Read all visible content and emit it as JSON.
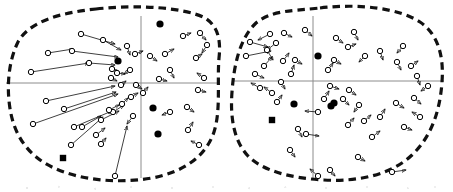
{
  "figure": {
    "type": "scatter",
    "width": 453,
    "height": 192,
    "background_color": "#ffffff",
    "stroke_color": "#000000",
    "axis_color": "#8c8c8c",
    "dash_color": "#111111",
    "marker_legend": [
      {
        "key": "open-circle-with-vector",
        "label": "open circle with velocity vector arrow"
      },
      {
        "key": "filled-circle",
        "label": "filled black circle"
      },
      {
        "key": "filled-square",
        "label": "filled black square"
      }
    ],
    "panels": [
      {
        "name": "left-panel",
        "axis": {
          "cx": 141,
          "cy": 83,
          "x_from": 6,
          "x_to": 218,
          "y_from": 16,
          "y_to": 178
        },
        "boundary": "M 96 9 C 140 4 186 8 205 18 C 218 26 221 40 219 58 C 217 82 221 110 214 132 C 206 156 184 172 152 178 C 118 184 80 180 54 168 C 30 157 16 138 11 114 C 6 90 8 62 18 42 C 29 22 58 13 96 9 Z",
        "filled_circles": [
          {
            "x": 160,
            "y": 24
          },
          {
            "x": 118,
            "y": 61
          },
          {
            "x": 153,
            "y": 108
          },
          {
            "x": 158,
            "y": 134
          }
        ],
        "filled_squares": [
          {
            "x": 63,
            "y": 158
          }
        ],
        "vectors": [
          {
            "x": 81,
            "y": 34,
            "dx": 34,
            "dy": 10
          },
          {
            "x": 103,
            "y": 40,
            "dx": 18,
            "dy": 10
          },
          {
            "x": 48,
            "y": 53,
            "dx": 25,
            "dy": -4
          },
          {
            "x": 72,
            "y": 51,
            "dx": 46,
            "dy": 6
          },
          {
            "x": 31,
            "y": 72,
            "dx": 58,
            "dy": -9
          },
          {
            "x": 89,
            "y": 63,
            "dx": 26,
            "dy": 2
          },
          {
            "x": 112,
            "y": 69,
            "dx": 7,
            "dy": 3
          },
          {
            "x": 117,
            "y": 73,
            "dx": 8,
            "dy": 1
          },
          {
            "x": 127,
            "y": 46,
            "dx": 3,
            "dy": 9
          },
          {
            "x": 135,
            "y": 54,
            "dx": 8,
            "dy": -3
          },
          {
            "x": 150,
            "y": 56,
            "dx": 7,
            "dy": 5
          },
          {
            "x": 165,
            "y": 54,
            "dx": 9,
            "dy": -5
          },
          {
            "x": 183,
            "y": 36,
            "dx": 8,
            "dy": -3
          },
          {
            "x": 200,
            "y": 33,
            "dx": 6,
            "dy": 7
          },
          {
            "x": 207,
            "y": 45,
            "dx": -5,
            "dy": 8
          },
          {
            "x": 196,
            "y": 58,
            "dx": 6,
            "dy": -4
          },
          {
            "x": 170,
            "y": 70,
            "dx": 4,
            "dy": 8
          },
          {
            "x": 159,
            "y": 79,
            "dx": 8,
            "dy": 2
          },
          {
            "x": 130,
            "y": 70,
            "dx": -6,
            "dy": 4
          },
          {
            "x": 111,
            "y": 78,
            "dx": 6,
            "dy": 3
          },
          {
            "x": 121,
            "y": 85,
            "dx": 5,
            "dy": -4
          },
          {
            "x": 136,
            "y": 85,
            "dx": 6,
            "dy": 4
          },
          {
            "x": 46,
            "y": 101,
            "dx": 69,
            "dy": -15
          },
          {
            "x": 64,
            "y": 109,
            "dx": 52,
            "dy": -17
          },
          {
            "x": 33,
            "y": 124,
            "dx": 85,
            "dy": -30
          },
          {
            "x": 74,
            "y": 127,
            "dx": 38,
            "dy": -16
          },
          {
            "x": 71,
            "y": 145,
            "dx": 32,
            "dy": -28
          },
          {
            "x": 82,
            "y": 127,
            "dx": 19,
            "dy": -11
          },
          {
            "x": 101,
            "y": 120,
            "dx": 18,
            "dy": -9
          },
          {
            "x": 113,
            "y": 112,
            "dx": 11,
            "dy": -7
          },
          {
            "x": 96,
            "y": 135,
            "dx": 9,
            "dy": -7
          },
          {
            "x": 101,
            "y": 144,
            "dx": 5,
            "dy": -6
          },
          {
            "x": 109,
            "y": 110,
            "dx": 10,
            "dy": -5
          },
          {
            "x": 122,
            "y": 104,
            "dx": 6,
            "dy": -6
          },
          {
            "x": 131,
            "y": 97,
            "dx": 7,
            "dy": -4
          },
          {
            "x": 143,
            "y": 93,
            "dx": 5,
            "dy": -6
          },
          {
            "x": 115,
            "y": 176,
            "dx": 12,
            "dy": -50
          },
          {
            "x": 133,
            "y": 116,
            "dx": -6,
            "dy": 8
          },
          {
            "x": 170,
            "y": 112,
            "dx": -8,
            "dy": 3
          },
          {
            "x": 187,
            "y": 107,
            "dx": 7,
            "dy": 5
          },
          {
            "x": 198,
            "y": 90,
            "dx": 8,
            "dy": 2
          },
          {
            "x": 204,
            "y": 78,
            "dx": -7,
            "dy": -5
          },
          {
            "x": 188,
            "y": 130,
            "dx": 5,
            "dy": -8
          },
          {
            "x": 199,
            "y": 145,
            "dx": -8,
            "dy": -4
          }
        ]
      },
      {
        "name": "right-panel",
        "axis": {
          "cx": 313,
          "cy": 81,
          "x_from": 234,
          "x_to": 444,
          "y_from": 16,
          "y_to": 178
        },
        "boundary": "M 320 8 C 362 3 400 9 420 22 C 438 34 444 56 442 82 C 440 110 432 136 412 155 C 392 174 360 182 324 180 C 288 178 262 170 248 156 C 234 141 230 118 232 92 C 234 64 240 38 256 23 C 272 10 292 11 320 8 Z",
        "filled_circles": [
          {
            "x": 318,
            "y": 56
          },
          {
            "x": 294,
            "y": 104
          },
          {
            "x": 334,
            "y": 103
          },
          {
            "x": 331,
            "y": 106
          }
        ],
        "filled_squares": [
          {
            "x": 272,
            "y": 120
          }
        ],
        "vectors": [
          {
            "x": 250,
            "y": 42,
            "dx": 18,
            "dy": 5
          },
          {
            "x": 276,
            "y": 43,
            "dx": -9,
            "dy": 7
          },
          {
            "x": 246,
            "y": 56,
            "dx": 25,
            "dy": -5
          },
          {
            "x": 267,
            "y": 50,
            "dx": 6,
            "dy": 10
          },
          {
            "x": 264,
            "y": 66,
            "dx": 8,
            "dy": -9
          },
          {
            "x": 284,
            "y": 33,
            "dx": 8,
            "dy": 4
          },
          {
            "x": 305,
            "y": 30,
            "dx": 7,
            "dy": 6
          },
          {
            "x": 283,
            "y": 61,
            "dx": 6,
            "dy": -8
          },
          {
            "x": 295,
            "y": 60,
            "dx": 7,
            "dy": 4
          },
          {
            "x": 291,
            "y": 74,
            "dx": 3,
            "dy": -9
          },
          {
            "x": 281,
            "y": 82,
            "dx": 4,
            "dy": 7
          },
          {
            "x": 272,
            "y": 93,
            "dx": -8,
            "dy": -6
          },
          {
            "x": 277,
            "y": 102,
            "dx": 5,
            "dy": -7
          },
          {
            "x": 270,
            "y": 34,
            "dx": -12,
            "dy": 6
          },
          {
            "x": 336,
            "y": 38,
            "dx": 7,
            "dy": 5
          },
          {
            "x": 354,
            "y": 32,
            "dx": 4,
            "dy": 8
          },
          {
            "x": 348,
            "y": 47,
            "dx": 8,
            "dy": -3
          },
          {
            "x": 365,
            "y": 56,
            "dx": -6,
            "dy": 6
          },
          {
            "x": 334,
            "y": 60,
            "dx": 7,
            "dy": 4
          },
          {
            "x": 328,
            "y": 70,
            "dx": 5,
            "dy": -7
          },
          {
            "x": 380,
            "y": 51,
            "dx": 3,
            "dy": 9
          },
          {
            "x": 397,
            "y": 62,
            "dx": 4,
            "dy": 8
          },
          {
            "x": 403,
            "y": 46,
            "dx": -6,
            "dy": 7
          },
          {
            "x": 330,
            "y": 86,
            "dx": 9,
            "dy": 3
          },
          {
            "x": 349,
            "y": 90,
            "dx": 7,
            "dy": 5
          },
          {
            "x": 359,
            "y": 105,
            "dx": -5,
            "dy": 7
          },
          {
            "x": 324,
            "y": 99,
            "dx": 5,
            "dy": -8
          },
          {
            "x": 343,
            "y": 99,
            "dx": 6,
            "dy": 6
          },
          {
            "x": 318,
            "y": 112,
            "dx": -13,
            "dy": -1
          },
          {
            "x": 306,
            "y": 134,
            "dx": 13,
            "dy": 2
          },
          {
            "x": 298,
            "y": 129,
            "dx": 4,
            "dy": 8
          },
          {
            "x": 290,
            "y": 150,
            "dx": 5,
            "dy": 7
          },
          {
            "x": 348,
            "y": 125,
            "dx": 6,
            "dy": -7
          },
          {
            "x": 364,
            "y": 121,
            "dx": 7,
            "dy": -6
          },
          {
            "x": 380,
            "y": 117,
            "dx": 5,
            "dy": -8
          },
          {
            "x": 372,
            "y": 137,
            "dx": 8,
            "dy": -6
          },
          {
            "x": 358,
            "y": 157,
            "dx": 7,
            "dy": 4
          },
          {
            "x": 396,
            "y": 103,
            "dx": 8,
            "dy": 5
          },
          {
            "x": 414,
            "y": 98,
            "dx": 7,
            "dy": 6
          },
          {
            "x": 420,
            "y": 117,
            "dx": -8,
            "dy": -5
          },
          {
            "x": 404,
            "y": 127,
            "dx": 8,
            "dy": 3
          },
          {
            "x": 417,
            "y": 76,
            "dx": 3,
            "dy": 9
          },
          {
            "x": 411,
            "y": 66,
            "dx": 7,
            "dy": -5
          },
          {
            "x": 428,
            "y": 86,
            "dx": -7,
            "dy": 5
          },
          {
            "x": 318,
            "y": 176,
            "dx": -8,
            "dy": -7
          },
          {
            "x": 330,
            "y": 170,
            "dx": 5,
            "dy": 6
          },
          {
            "x": 392,
            "y": 172,
            "dx": 14,
            "dy": -2
          },
          {
            "x": 255,
            "y": 74,
            "dx": 9,
            "dy": 4
          },
          {
            "x": 260,
            "y": 88,
            "dx": -9,
            "dy": -5
          }
        ]
      }
    ]
  }
}
